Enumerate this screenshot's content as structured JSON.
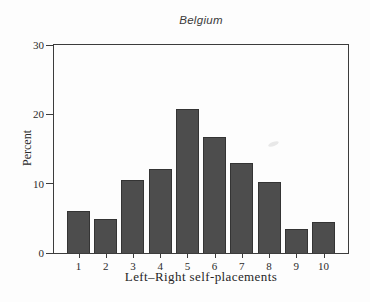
{
  "page": {
    "background_color": "#fdfdfd"
  },
  "chart_data": {
    "type": "bar",
    "title": "Belgium",
    "categories": [
      "1",
      "2",
      "3",
      "4",
      "5",
      "6",
      "7",
      "8",
      "9",
      "10"
    ],
    "values": [
      6.0,
      4.9,
      10.5,
      12.1,
      20.7,
      16.7,
      13.0,
      10.2,
      3.5,
      4.5
    ],
    "xlabel": "Left–Right self-placements",
    "ylabel": "Percent",
    "ylim": [
      0,
      30
    ],
    "yticks": [
      0,
      10,
      20,
      30
    ],
    "grid": false,
    "legend": "none",
    "bar_color": "#4d4d4d",
    "bar_border_color": "#343434",
    "axis_color": "#3c3c3c",
    "text_color": "#2b2b2b"
  }
}
